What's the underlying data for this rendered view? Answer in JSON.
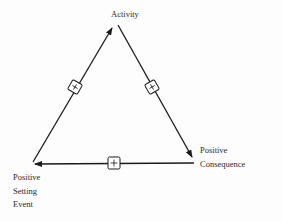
{
  "diagram": {
    "nodes": [
      {
        "id": "activity",
        "label": "Activity"
      },
      {
        "id": "consequence",
        "label_lines": [
          "Positive",
          "Consequence"
        ]
      },
      {
        "id": "setting",
        "label_lines": [
          "Positive",
          "Setting",
          "Event"
        ]
      }
    ],
    "edges": [
      {
        "from": "setting",
        "to": "activity",
        "sign": "+"
      },
      {
        "from": "activity",
        "to": "consequence",
        "sign": "+"
      },
      {
        "from": "consequence",
        "to": "setting",
        "sign": "+"
      }
    ],
    "colors": {
      "line": "#1a1a1a",
      "text": "#2a2a2a",
      "background": "#fdfdfd"
    }
  }
}
